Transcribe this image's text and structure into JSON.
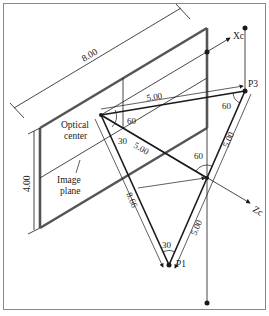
{
  "diagram": {
    "labels": {
      "width_dim": "8.00",
      "height_dim": "4.00",
      "axis_x": "Xc",
      "axis_z": "Zc",
      "point_p1": "P1",
      "point_p3": "P3",
      "optical_center_line1": "Optical",
      "optical_center_line2": "center",
      "image_plane_line1": "Image",
      "image_plane_line2": "plane",
      "dist_o_p3": "5.00",
      "dist_o_z": "5.00",
      "dist_p3_z": "5.00",
      "dist_z_p1": "5.00",
      "dist_o_p1": "8.66",
      "angle_o_top": "60",
      "angle_o_bottom": "30",
      "angle_p3": "60",
      "angle_z": "60",
      "angle_p1": "30"
    },
    "colors": {
      "line": "#1a1a1a",
      "plane_edge": "#555555",
      "frame": "#888888",
      "background": "#ffffff"
    }
  }
}
